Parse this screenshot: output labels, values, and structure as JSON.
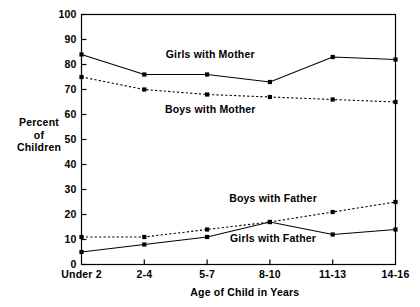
{
  "chart_data": {
    "type": "line",
    "title": "",
    "xlabel": "Age of Child in Years",
    "ylabel": "Percent of Children",
    "ylabel_lines": [
      "Percent",
      "of",
      "Children"
    ],
    "categories": [
      "Under 2",
      "2-4",
      "5-7",
      "8-10",
      "11-13",
      "14-16"
    ],
    "ylim": [
      0,
      100
    ],
    "yticks": [
      0,
      10,
      20,
      30,
      40,
      50,
      60,
      70,
      80,
      90,
      100
    ],
    "grid": false,
    "legend_position": "inline-annotations",
    "series": [
      {
        "name": "Girls with Mother",
        "style": "solid",
        "marker": "square",
        "color": "#000000",
        "values": [
          84,
          76,
          76,
          73,
          83,
          82
        ]
      },
      {
        "name": "Boys with Mother",
        "style": "dotted",
        "marker": "square",
        "color": "#000000",
        "values": [
          75,
          70,
          68,
          67,
          66,
          65
        ]
      },
      {
        "name": "Boys with Father",
        "style": "dotted",
        "marker": "square",
        "color": "#000000",
        "values": [
          11,
          11,
          14,
          17,
          21,
          25
        ]
      },
      {
        "name": "Girls with Father",
        "style": "solid",
        "marker": "square",
        "color": "#000000",
        "values": [
          5,
          8,
          11,
          17,
          12,
          14
        ]
      }
    ],
    "annotations": [
      {
        "text": "Girls with Mother",
        "category_index": 2.05,
        "value": 82.5
      },
      {
        "text": "Boys with Mother",
        "category_index": 2.05,
        "value": 60.5
      },
      {
        "text": "Boys with Father",
        "category_index": 3.05,
        "value": 25.0
      },
      {
        "text": "Girls with Father",
        "category_index": 3.05,
        "value": 9.0
      }
    ]
  }
}
